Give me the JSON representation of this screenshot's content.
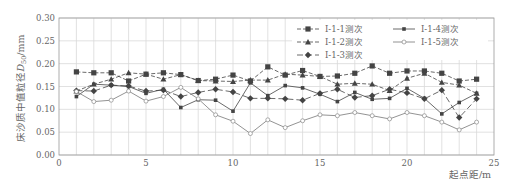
{
  "chart_data": {
    "type": "line",
    "title": "",
    "xlabel": "起点距/m",
    "ylabel": "床沙质中值粒径D50/mm",
    "ylabel_main": "床沙质中值粒径",
    "ylabel_sym": "D",
    "ylabel_sub": "50",
    "ylabel_unit": "/mm",
    "xlim": [
      0,
      25
    ],
    "ylim": [
      0,
      0.3
    ],
    "xticks": [
      0,
      5,
      10,
      15,
      20,
      25
    ],
    "yticks": [
      "0.00",
      "0.05",
      "0.10",
      "0.15",
      "0.20",
      "0.25",
      "0.30"
    ],
    "grid": true,
    "legend_position": "upper right (inside)",
    "x": [
      1,
      2,
      3,
      4,
      5,
      6,
      7,
      8,
      9,
      10,
      11,
      12,
      13,
      14,
      15,
      16,
      17,
      18,
      19,
      20,
      21,
      22,
      23,
      24
    ],
    "series": [
      {
        "name": "Ⅰ-1-1测次",
        "marker": "square-large",
        "dash": "4,2",
        "values": [
          0.182,
          0.18,
          0.18,
          0.162,
          0.177,
          0.18,
          0.176,
          0.163,
          0.166,
          0.175,
          0.162,
          0.193,
          0.175,
          0.185,
          0.172,
          0.173,
          0.179,
          0.195,
          0.179,
          0.184,
          0.184,
          0.179,
          0.162,
          0.166
        ]
      },
      {
        "name": "Ⅰ-1-2测次",
        "marker": "triangle",
        "dash": "4,2",
        "values": [
          0.14,
          0.155,
          0.166,
          0.18,
          0.177,
          0.166,
          0.176,
          0.163,
          0.162,
          0.161,
          0.164,
          0.164,
          0.177,
          0.175,
          0.172,
          0.155,
          0.157,
          0.155,
          0.141,
          0.168,
          0.179,
          0.159,
          0.153,
          0.135
        ]
      },
      {
        "name": "Ⅰ-1-3测次",
        "marker": "diamond",
        "dash": "6,3",
        "values": [
          0.141,
          0.14,
          0.153,
          0.151,
          0.14,
          0.142,
          0.128,
          0.137,
          0.144,
          0.138,
          0.124,
          0.124,
          0.123,
          0.12,
          0.135,
          0.144,
          0.126,
          0.13,
          0.144,
          0.136,
          0.123,
          0.142,
          0.082,
          0.123
        ]
      },
      {
        "name": "Ⅰ-1-4测次",
        "marker": "square-small",
        "dash": "",
        "values": [
          0.128,
          0.155,
          0.153,
          0.15,
          0.135,
          0.144,
          0.104,
          0.121,
          0.12,
          0.096,
          0.158,
          0.13,
          0.152,
          0.147,
          0.133,
          0.117,
          0.137,
          0.122,
          0.124,
          0.146,
          0.124,
          0.09,
          0.115,
          0.135
        ]
      },
      {
        "name": "Ⅰ-1-5测次",
        "marker": "circle-open",
        "dash": "",
        "values": [
          0.139,
          0.117,
          0.12,
          0.14,
          0.118,
          0.128,
          0.148,
          0.123,
          0.088,
          0.074,
          0.047,
          0.077,
          0.06,
          0.075,
          0.088,
          0.086,
          0.093,
          0.086,
          0.079,
          0.093,
          0.086,
          0.072,
          0.055,
          0.072
        ]
      }
    ]
  },
  "colors": {
    "line": "#444444",
    "grid": "#d9d9d9",
    "axis": "#999999",
    "text": "#666666"
  }
}
